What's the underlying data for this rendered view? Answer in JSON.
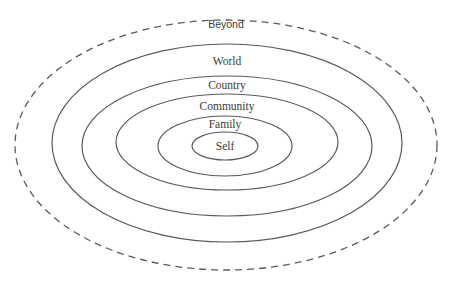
{
  "diagram": {
    "type": "concentric-ellipses",
    "stroke_color": "#5a5a5a",
    "label_color": "#3a3a3a",
    "rings": [
      {
        "label": "Beyond",
        "style": "dashed",
        "cx": 226,
        "cy": 145,
        "rx": 211,
        "ry": 125,
        "label_y": 28
      },
      {
        "label": "World",
        "style": "solid",
        "cx": 227,
        "cy": 143,
        "rx": 175,
        "ry": 99,
        "label_y": 65
      },
      {
        "label": "Country",
        "style": "solid",
        "cx": 227,
        "cy": 146,
        "rx": 145,
        "ry": 70,
        "label_y": 89
      },
      {
        "label": "Community",
        "style": "solid",
        "cx": 227,
        "cy": 142,
        "rx": 111,
        "ry": 48,
        "label_y": 110
      },
      {
        "label": "Family",
        "style": "solid",
        "cx": 225,
        "cy": 146,
        "rx": 67,
        "ry": 30,
        "label_y": 128
      },
      {
        "label": "Self",
        "style": "solid",
        "cx": 225,
        "cy": 146,
        "rx": 33,
        "ry": 14,
        "label_y": 150
      }
    ]
  }
}
